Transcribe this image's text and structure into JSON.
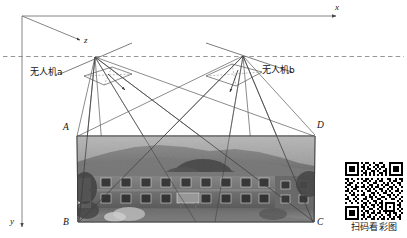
{
  "figure": {
    "axes": {
      "x_label": "x",
      "y_label": "z",
      "z_label": "z",
      "vertical_label": "y",
      "origin": {
        "x": 22,
        "y": 16
      }
    },
    "axis_labels": {
      "x": "x",
      "y": "y",
      "z": "z"
    },
    "uav": [
      {
        "id": "a",
        "label": "无人机a",
        "x": 95,
        "y": 57
      },
      {
        "id": "b",
        "label": "无人机b",
        "x": 243,
        "y": 56
      }
    ],
    "corner_labels": {
      "top_left": "A",
      "bottom_left": "B",
      "bottom_right": "C",
      "top_right": "D"
    },
    "ground_image": {
      "caption": "",
      "description": "aerial grayscale photo of a two-storey building with trees and hillside"
    },
    "qr": {
      "caption": "扫码看彩图"
    },
    "colors": {
      "line": "#555555",
      "axis": "#777777",
      "dashed": "#888888",
      "text": "#111111",
      "background": "#ffffff"
    }
  }
}
